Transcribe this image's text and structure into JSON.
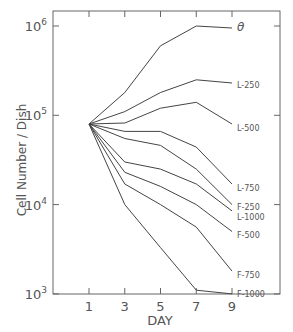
{
  "chart_data": {
    "type": "line",
    "title": "",
    "xlabel": "DAY",
    "ylabel": "Cell Number / Dish",
    "yscale": "log",
    "ylim": [
      1000,
      1000000
    ],
    "xlim": [
      -1,
      11
    ],
    "grid": false,
    "legend": "inline labels at line ends",
    "x": [
      1,
      3,
      5,
      7,
      9
    ],
    "x_ticks": [
      "1",
      "3",
      "5",
      "7",
      "9"
    ],
    "y_ticks": [
      {
        "value": 1000,
        "base": "10",
        "exp": "3"
      },
      {
        "value": 10000,
        "base": "10",
        "exp": "4"
      },
      {
        "value": 100000,
        "base": "10",
        "exp": "5"
      },
      {
        "value": 1000000,
        "base": "10",
        "exp": "6"
      }
    ],
    "series": [
      {
        "name": "θ",
        "values": [
          80000,
          180000,
          600000,
          1000000,
          950000
        ]
      },
      {
        "name": "L-250",
        "values": [
          80000,
          110000,
          180000,
          250000,
          230000
        ]
      },
      {
        "name": "L-500",
        "values": [
          80000,
          82000,
          120000,
          140000,
          80000
        ]
      },
      {
        "name": "L-750",
        "values": [
          80000,
          66000,
          66000,
          44000,
          17000
        ]
      },
      {
        "name": "F-250",
        "values": [
          80000,
          55000,
          46000,
          25000,
          10000
        ]
      },
      {
        "name": "L-1000",
        "values": [
          80000,
          30000,
          25000,
          17000,
          8500
        ]
      },
      {
        "name": "F-500",
        "values": [
          80000,
          23000,
          16000,
          10000,
          5000
        ]
      },
      {
        "name": "F-750",
        "values": [
          80000,
          17000,
          10000,
          5600,
          1800
        ]
      },
      {
        "name": "F-1000",
        "values": [
          80000,
          10000,
          3300,
          1100,
          1000
        ]
      }
    ]
  }
}
